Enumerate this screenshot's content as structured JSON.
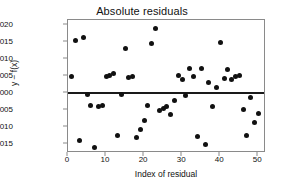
{
  "chart_data": {
    "type": "scatter",
    "title": "Absolute residuals",
    "xlabel": "Index of residual",
    "ylabel": "y − f(x)",
    "xlim": [
      0,
      51.5
    ],
    "ylim": [
      -0.0017,
      0.00215
    ],
    "grid": false,
    "legend": null,
    "marker": "filled-circle",
    "marker_color": "#111111",
    "reference_line": {
      "y": 0.0,
      "color": "#1a1a1a",
      "label": "zero-residual-line"
    },
    "x": [
      1,
      2,
      3,
      4,
      5,
      6,
      7,
      8,
      9,
      10,
      11,
      12,
      13,
      14,
      15,
      16,
      17,
      18,
      19,
      20,
      21,
      22,
      23,
      24,
      25,
      26,
      27,
      28,
      29,
      30,
      31,
      32,
      33,
      34,
      35,
      36,
      37,
      38,
      39,
      40,
      41,
      42,
      43,
      44,
      45,
      46,
      47,
      48,
      49,
      50
    ],
    "y": [
      0.0005,
      0.00155,
      -0.00138,
      0.00165,
      -5e-05,
      -0.00037,
      -0.00159,
      -0.0004,
      -0.00037,
      0.00048,
      0.00052,
      0.00058,
      -0.00123,
      -5e-05,
      0.00131,
      0.00046,
      0.00048,
      -0.0013,
      -0.00106,
      -0.00079,
      -0.00037,
      0.00146,
      0.00189,
      -0.0005,
      -0.00045,
      -0.00038,
      -0.00063,
      -0.00022,
      0.00052,
      0.00039,
      -8e-05,
      0.00072,
      0.0005,
      -0.00128,
      0.00071,
      -0.0015,
      0.0003,
      -0.00038,
      0.00016,
      0.00148,
      0.00044,
      0.00069,
      0.0004,
      0.00048,
      0.00053,
      -0.00047,
      -0.00124,
      -0.00012,
      -0.00085,
      -0.0006
    ],
    "xticks": [
      0,
      10,
      20,
      30,
      40,
      50
    ],
    "xtick_labels": [
      "0",
      "10",
      "20",
      "30",
      "40",
      "50"
    ],
    "yticks": [
      0.002,
      0.0015,
      0.001,
      0.0005,
      0.0,
      -0.0005,
      -0.001,
      -0.0015
    ],
    "ytick_labels": [
      "0.0020",
      "0.0015",
      "0.0010",
      "0.0005",
      "0.0000",
      "−0.0005",
      "−0.0010",
      "−0.0015"
    ]
  }
}
